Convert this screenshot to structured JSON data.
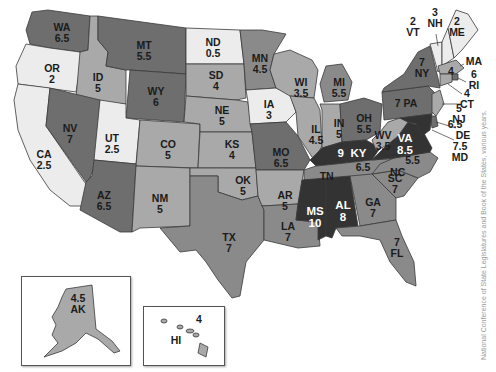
{
  "map": {
    "title": "US map of state values",
    "source": "National Conference of State Legislatures and Book of the States, various years.",
    "shade_scale": {
      "lightest": "#ececec",
      "light": "#a9a9a9",
      "medium": "#8a8a8a",
      "dark": "#6e6e6e",
      "darkest": "#333333"
    },
    "states": {
      "WA": {
        "abbr": "WA",
        "value": "6.5"
      },
      "OR": {
        "abbr": "OR",
        "value": "2"
      },
      "CA": {
        "abbr": "CA",
        "value": "2.5"
      },
      "ID": {
        "abbr": "ID",
        "value": "5"
      },
      "NV": {
        "abbr": "NV",
        "value": "7"
      },
      "MT": {
        "abbr": "MT",
        "value": "5.5"
      },
      "WY": {
        "abbr": "WY",
        "value": "6"
      },
      "UT": {
        "abbr": "UT",
        "value": "2.5"
      },
      "CO": {
        "abbr": "CO",
        "value": "5"
      },
      "AZ": {
        "abbr": "AZ",
        "value": "6.5"
      },
      "NM": {
        "abbr": "NM",
        "value": "5"
      },
      "ND": {
        "abbr": "ND",
        "value": "0.5"
      },
      "SD": {
        "abbr": "SD",
        "value": "4"
      },
      "NE": {
        "abbr": "NE",
        "value": "5"
      },
      "KS": {
        "abbr": "KS",
        "value": "4"
      },
      "OK": {
        "abbr": "OK",
        "value": "5"
      },
      "TX": {
        "abbr": "TX",
        "value": "7"
      },
      "MN": {
        "abbr": "MN",
        "value": "4.5"
      },
      "IA": {
        "abbr": "IA",
        "value": "3"
      },
      "MO": {
        "abbr": "MO",
        "value": "6.5"
      },
      "AR": {
        "abbr": "AR",
        "value": "5"
      },
      "LA": {
        "abbr": "LA",
        "value": "7"
      },
      "WI": {
        "abbr": "WI",
        "value": "3.5"
      },
      "IL": {
        "abbr": "IL",
        "value": "4.5"
      },
      "MI": {
        "abbr": "MI",
        "value": "5.5"
      },
      "IN": {
        "abbr": "IN",
        "value": "5"
      },
      "OH": {
        "abbr": "OH",
        "value": "5.5"
      },
      "KY": {
        "abbr": "KY",
        "value": "9"
      },
      "TN": {
        "abbr": "TN",
        "value": "6.5"
      },
      "MS": {
        "abbr": "MS",
        "value": "10"
      },
      "AL": {
        "abbr": "AL",
        "value": "8"
      },
      "GA": {
        "abbr": "GA",
        "value": "7"
      },
      "FL": {
        "abbr": "FL",
        "value": "7"
      },
      "SC": {
        "abbr": "SC",
        "value": "7"
      },
      "NC": {
        "abbr": "NC",
        "value": "5.5"
      },
      "VA": {
        "abbr": "VA",
        "value": "8.5"
      },
      "WV": {
        "abbr": "WV",
        "value": "3.5"
      },
      "PA": {
        "abbr": "PA",
        "value": "7"
      },
      "NY": {
        "abbr": "NY",
        "value": "7"
      },
      "VT": {
        "abbr": "VT",
        "value": "2"
      },
      "NH": {
        "abbr": "NH",
        "value": "3"
      },
      "ME": {
        "abbr": "ME",
        "value": "2"
      },
      "MA": {
        "abbr": "MA",
        "value": "4"
      },
      "RI": {
        "abbr": "RI",
        "value": "6"
      },
      "CT": {
        "abbr": "CT",
        "value": "4"
      },
      "NJ": {
        "abbr": "NJ",
        "value": "5"
      },
      "DE": {
        "abbr": "DE",
        "value": "6.5"
      },
      "MD": {
        "abbr": "MD",
        "value": "7.5"
      },
      "AK": {
        "abbr": "AK",
        "value": "4.5"
      },
      "HI": {
        "abbr": "HI",
        "value": "4"
      }
    }
  }
}
